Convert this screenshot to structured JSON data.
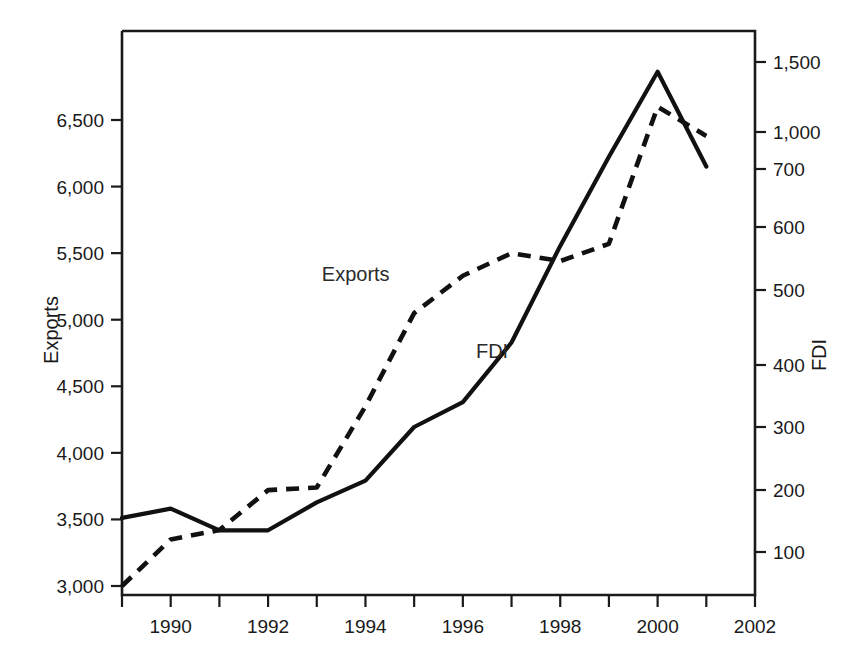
{
  "chart_data": {
    "type": "line",
    "title": "",
    "subtitle": "",
    "xlabel": "",
    "ylabel": "Exports",
    "y2label": "FDI",
    "grid": false,
    "legend_position": "inline-annotations",
    "x": [
      1989,
      1990,
      1991,
      1992,
      1993,
      1994,
      1995,
      1996,
      1997,
      1998,
      1999,
      2000,
      2001
    ],
    "xlim": [
      1989,
      2002
    ],
    "x_tick_values": [
      1989,
      1990,
      1991,
      1992,
      1993,
      1994,
      1995,
      1996,
      1997,
      1998,
      1999,
      2000,
      2001,
      2002
    ],
    "x_tick_labels": [
      "",
      "1990",
      "",
      "1992",
      "",
      "1994",
      "",
      "1996",
      "",
      "1998",
      "",
      "2000",
      "",
      "2002"
    ],
    "y_tick_labels": [
      "6,500",
      "6,000",
      "5,500",
      "5,000",
      "4,500",
      "4,000",
      "3,500",
      "3,000"
    ],
    "y_tick_values": [
      6500,
      6000,
      5500,
      5000,
      4500,
      4000,
      3500,
      3000
    ],
    "ylim": [
      2800,
      6900
    ],
    "y2_tick_labels": [
      "1,500",
      "1,000",
      "700",
      "600",
      "500",
      "400",
      "300",
      "200",
      "100"
    ],
    "y2_tick_values": [
      1500,
      1000,
      700,
      600,
      500,
      400,
      300,
      200,
      100
    ],
    "y2_scale": "nonlinear",
    "series": [
      {
        "name": "Exports",
        "axis": "left",
        "style": "dashed",
        "color": "#111111",
        "label_text": "Exports",
        "values": [
          3000,
          3350,
          3420,
          3720,
          3740,
          4350,
          5050,
          5330,
          5500,
          5440,
          5570,
          6600,
          6380
        ]
      },
      {
        "name": "FDI",
        "axis": "right",
        "style": "solid",
        "color": "#111111",
        "label_text": "FDI",
        "values": [
          155,
          170,
          135,
          135,
          180,
          215,
          300,
          340,
          430,
          570,
          800,
          1430,
          720
        ]
      }
    ],
    "annotations": [
      {
        "text": "Exports",
        "x": 1993.8,
        "y_px": 281
      },
      {
        "text": "FDI",
        "x": 1996.6,
        "y_px": 358
      }
    ]
  },
  "axes": {
    "left_title": "Exports",
    "right_title": "FDI"
  }
}
